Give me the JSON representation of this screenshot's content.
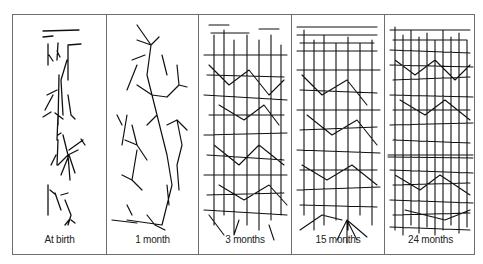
{
  "figure": {
    "panels": [
      {
        "label": "At birth",
        "density": 1
      },
      {
        "label": "1 month",
        "density": 2
      },
      {
        "label": "3 months",
        "density": 4
      },
      {
        "label": "15 months",
        "density": 5
      },
      {
        "label": "24 months",
        "density": 6
      }
    ],
    "colors": {
      "ink": "#111111",
      "border": "#6e6e6e",
      "background": "#ffffff"
    }
  }
}
